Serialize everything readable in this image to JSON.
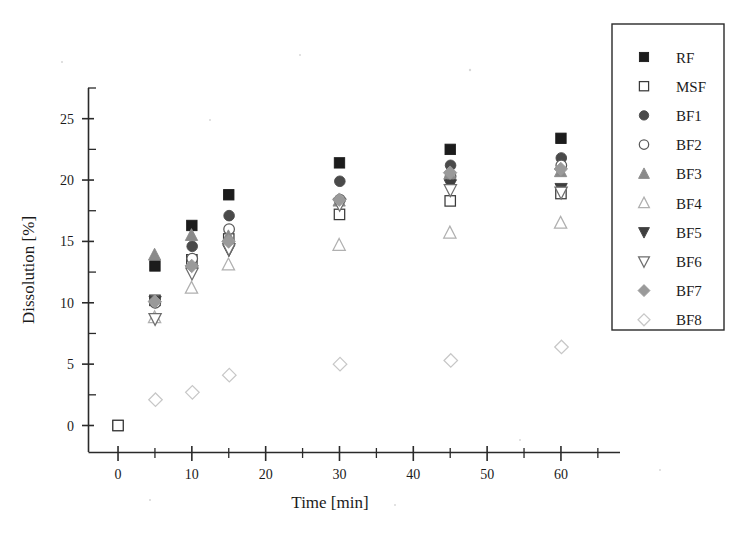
{
  "chart_data": {
    "type": "scatter",
    "title": "",
    "xlabel": "Time [min]",
    "ylabel": "Dissolution [%]",
    "xlim": [
      -4,
      68
    ],
    "ylim": [
      -2.2,
      27.5
    ],
    "xticks": [
      0,
      10,
      20,
      30,
      40,
      50,
      60
    ],
    "xticks_minor": [
      5,
      15,
      25,
      35,
      45,
      55,
      65
    ],
    "yticks": [
      0,
      5,
      10,
      15,
      20,
      25
    ],
    "yticks_minor": [
      2.5,
      7.5,
      12.5,
      17.5,
      22.5,
      27.5
    ],
    "grid": false,
    "legend_position": "top-right-outside",
    "x": [
      0,
      5,
      10,
      15,
      30,
      45,
      60
    ],
    "series": [
      {
        "name": "RF",
        "marker": "filled-square",
        "color": "#1c1c1c",
        "values": [
          0.0,
          13.0,
          16.3,
          18.8,
          21.4,
          22.5,
          23.4
        ]
      },
      {
        "name": "MSF",
        "marker": "open-square",
        "color": "#3a3a3a",
        "values": [
          0.0,
          10.2,
          13.5,
          15.2,
          17.2,
          18.3,
          18.9
        ]
      },
      {
        "name": "BF1",
        "marker": "filled-circle",
        "color": "#4a4a4a",
        "values": [
          0.0,
          10.1,
          14.6,
          17.1,
          19.9,
          21.2,
          21.8
        ]
      },
      {
        "name": "BF2",
        "marker": "open-circle",
        "color": "#5a5a5a",
        "values": [
          0.0,
          10.0,
          13.6,
          16.0,
          18.4,
          20.3,
          21.2
        ]
      },
      {
        "name": "BF3",
        "marker": "filled-triangle-up",
        "color": "#8a8a8a",
        "values": [
          0.0,
          13.9,
          15.5,
          15.4,
          18.3,
          20.5,
          20.7
        ]
      },
      {
        "name": "BF4",
        "marker": "open-triangle-up",
        "color": "#b0b0b0",
        "values": [
          0.0,
          8.8,
          11.2,
          13.1,
          14.7,
          15.7,
          16.5
        ]
      },
      {
        "name": "BF5",
        "marker": "filled-triangle-down",
        "color": "#3f3f3f",
        "values": [
          0.0,
          10.1,
          12.6,
          14.3,
          18.1,
          19.6,
          19.3
        ]
      },
      {
        "name": "BF6",
        "marker": "open-triangle-down",
        "color": "#6e6e6e",
        "values": [
          0.0,
          8.7,
          12.4,
          14.4,
          18.0,
          19.2,
          19.0
        ]
      },
      {
        "name": "BF7",
        "marker": "filled-diamond",
        "color": "#9a9a9a",
        "values": [
          0.0,
          10.1,
          13.0,
          15.0,
          18.4,
          20.6,
          20.9
        ]
      },
      {
        "name": "BF8",
        "marker": "open-diamond",
        "color": "#c7c7c7",
        "values": [
          0.0,
          2.1,
          2.7,
          4.1,
          5.0,
          5.3,
          6.4
        ]
      }
    ]
  },
  "legend": {
    "entries": [
      {
        "label": "RF"
      },
      {
        "label": "MSF"
      },
      {
        "label": "BF1"
      },
      {
        "label": "BF2"
      },
      {
        "label": "BF3"
      },
      {
        "label": "BF4"
      },
      {
        "label": "BF5"
      },
      {
        "label": "BF6"
      },
      {
        "label": "BF7"
      },
      {
        "label": "BF8"
      }
    ]
  },
  "axes": {
    "x_title": "Time [min]",
    "y_title": "Dissolution [%]",
    "x_tick_labels": [
      "0",
      "10",
      "20",
      "30",
      "40",
      "50",
      "60"
    ],
    "y_tick_labels": [
      "0",
      "5",
      "10",
      "15",
      "20",
      "25"
    ]
  }
}
